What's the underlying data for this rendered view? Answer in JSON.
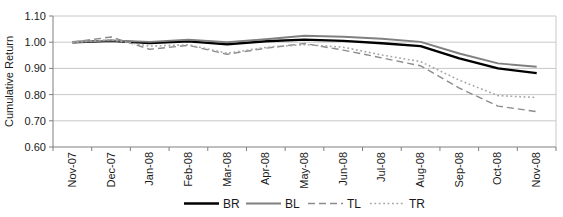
{
  "chart_data": {
    "type": "line",
    "title": "",
    "xlabel": "",
    "ylabel": "Cumulative Return",
    "ylim": [
      0.6,
      1.1
    ],
    "ytick_step": 0.1,
    "ytick_labels": [
      "0.60",
      "0.70",
      "0.80",
      "0.90",
      "1.00",
      "1.10"
    ],
    "grid": true,
    "legend_position": "bottom",
    "categories": [
      "Nov-07",
      "Dec-07",
      "Jan-08",
      "Feb-08",
      "Mar-08",
      "Apr-08",
      "May-08",
      "Jun-08",
      "Jul-08",
      "Aug-08",
      "Sep-08",
      "Oct-08",
      "Nov-08"
    ],
    "series": [
      {
        "name": "BR",
        "color": "#000000",
        "width": 2.4,
        "dash": "",
        "values": [
          1.0,
          1.005,
          0.997,
          1.003,
          0.992,
          1.004,
          1.01,
          1.005,
          0.996,
          0.985,
          0.938,
          0.9,
          0.882
        ]
      },
      {
        "name": "BL",
        "color": "#808080",
        "width": 1.9,
        "dash": "",
        "values": [
          1.0,
          1.007,
          1.001,
          1.01,
          1.0,
          1.011,
          1.025,
          1.021,
          1.013,
          1.001,
          0.957,
          0.919,
          0.906
        ]
      },
      {
        "name": "TL",
        "color": "#8c8c8c",
        "width": 1.4,
        "dash": "7 4",
        "values": [
          1.0,
          1.02,
          0.973,
          0.988,
          0.954,
          0.977,
          0.995,
          0.97,
          0.94,
          0.91,
          0.825,
          0.756,
          0.735
        ]
      },
      {
        "name": "TR",
        "color": "#a6a6a6",
        "width": 1.6,
        "dash": "1.8 2.6",
        "values": [
          1.0,
          1.009,
          0.985,
          0.99,
          0.958,
          0.98,
          0.991,
          0.981,
          0.951,
          0.926,
          0.855,
          0.796,
          0.789
        ]
      }
    ]
  },
  "style": {
    "grid_color": "#c8c8c8",
    "axis_color": "#7f7f7f",
    "label_color": "#1a1a1a"
  }
}
